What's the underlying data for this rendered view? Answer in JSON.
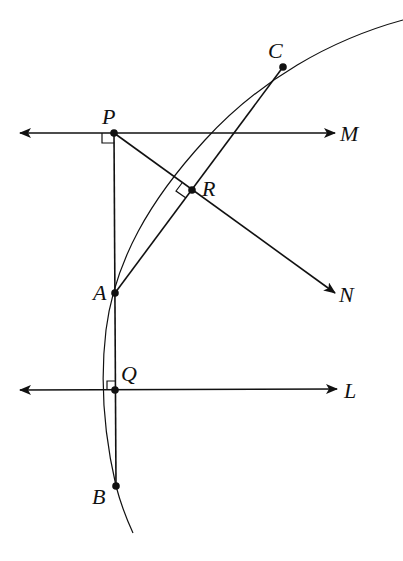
{
  "diagram": {
    "type": "geometry-construction",
    "colors": {
      "stroke": "#111111",
      "background": "#ffffff"
    },
    "points": [
      {
        "id": "P",
        "label": "P",
        "x": 114,
        "y": 133,
        "label_x": 100,
        "label_y": 124
      },
      {
        "id": "R",
        "label": "R",
        "x": 192,
        "y": 190,
        "label_x": 202,
        "label_y": 196
      },
      {
        "id": "C",
        "label": "C",
        "x": 283,
        "y": 67,
        "label_x": 268,
        "label_y": 58
      },
      {
        "id": "A",
        "label": "A",
        "x": 115,
        "y": 293,
        "label_x": 93,
        "label_y": 300
      },
      {
        "id": "Q",
        "label": "Q",
        "x": 115,
        "y": 390,
        "label_x": 121,
        "label_y": 381
      },
      {
        "id": "B",
        "label": "B",
        "x": 116,
        "y": 486,
        "label_x": 92,
        "label_y": 504
      }
    ],
    "rays": [
      {
        "id": "M",
        "label": "M",
        "label_x": 340,
        "label_y": 141
      },
      {
        "id": "N",
        "label": "N",
        "label_x": 339,
        "label_y": 302
      },
      {
        "id": "L",
        "label": "L",
        "label_x": 344,
        "label_y": 398
      }
    ],
    "right_angles": [
      "P",
      "R",
      "Q"
    ]
  }
}
